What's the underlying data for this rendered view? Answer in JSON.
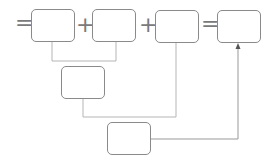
{
  "diagram": {
    "operators": [
      "=",
      "+",
      "+",
      "="
    ],
    "boxes": [
      {
        "id": "box-1",
        "value": ""
      },
      {
        "id": "box-2",
        "value": ""
      },
      {
        "id": "box-3",
        "value": ""
      },
      {
        "id": "box-4",
        "value": ""
      },
      {
        "id": "box-5",
        "value": ""
      },
      {
        "id": "box-6",
        "value": ""
      }
    ],
    "colors": {
      "stroke": "#8a8a8a",
      "line": "#b0b0b0",
      "background": "#ffffff"
    }
  }
}
